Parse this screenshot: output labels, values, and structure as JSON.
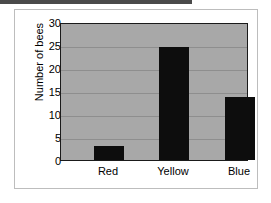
{
  "chart_data": {
    "type": "bar",
    "title": "",
    "xlabel": "",
    "ylabel": "Number of bees",
    "categories": [
      "Red",
      "Yellow",
      "Blue"
    ],
    "values": [
      3,
      25,
      14
    ],
    "ylim": [
      0,
      30
    ],
    "yticks": [
      0,
      5,
      10,
      15,
      20,
      25,
      30
    ],
    "ytick_labels": [
      "0",
      "5",
      "10",
      "15",
      "20",
      "25",
      "30"
    ],
    "grid": true,
    "legend": "none",
    "series_color": "#0d0d0d",
    "plot_background": "#a8a8a8",
    "gridline_color": "#8e8e8e",
    "axis_color": "#1a1a1a"
  }
}
